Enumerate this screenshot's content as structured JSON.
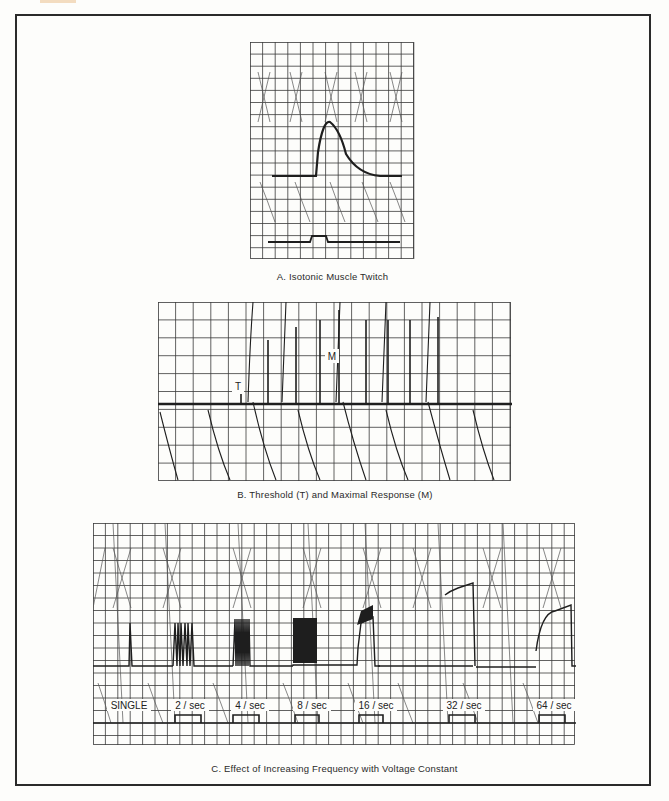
{
  "document": {
    "figure_title": "Kymograph recordings of frog gastrocnemius muscle",
    "panels": [
      {
        "id": "A",
        "caption": "A.  Isotonic Muscle Twitch"
      },
      {
        "id": "B",
        "caption": "B.  Threshold (T) and Maximal Response (M)",
        "markers": {
          "threshold": "T",
          "maximal": "M"
        }
      },
      {
        "id": "C",
        "caption": "C.  Effect of Increasing Frequency with Voltage Constant",
        "frequency_labels": [
          "SINGLE",
          "2 / sec",
          "4 / sec",
          "8 / sec",
          "16 / sec",
          "32 / sec",
          "64 / sec"
        ]
      }
    ]
  },
  "colors": {
    "ink": "#1e1e1e",
    "grid": "#3a3a3a",
    "paper": "#fdfdfb",
    "frame": "#2a2a2a",
    "tab": "#f3dcc0"
  },
  "chart_data": [
    {
      "type": "line",
      "title": "A. Isotonic Muscle Twitch",
      "series": [
        {
          "name": "muscle contraction trace",
          "x": [
            0,
            0.38,
            0.4,
            0.45,
            0.52,
            0.62,
            0.75,
            1.0
          ],
          "values": [
            0,
            0,
            0.2,
            1.0,
            0.8,
            0.4,
            0.1,
            0
          ]
        },
        {
          "name": "stimulus marker",
          "x": [
            0,
            0.35,
            0.36,
            0.48,
            0.49,
            1.0
          ],
          "values": [
            0,
            0,
            1,
            1,
            0,
            0
          ]
        }
      ]
    },
    {
      "type": "bar",
      "title": "B. Threshold (T) and Maximal Response (M)",
      "categories": [
        "1",
        "2",
        "3",
        "4",
        "5",
        "6",
        "7",
        "8",
        "9"
      ],
      "values": [
        0.15,
        0.65,
        0.85,
        0.92,
        1.0,
        0.92,
        0.92,
        0.92,
        0.92
      ],
      "annotations": [
        {
          "label": "T",
          "index": 0
        },
        {
          "label": "M",
          "index": 4
        }
      ]
    },
    {
      "type": "line",
      "title": "C. Effect of Increasing Frequency with Voltage Constant",
      "categories": [
        "SINGLE",
        "2 / sec",
        "4 / sec",
        "8 / sec",
        "16 / sec",
        "32 / sec",
        "64 / sec"
      ],
      "series": [
        {
          "name": "peak tension (relative)",
          "values": [
            0.37,
            0.37,
            0.37,
            0.37,
            0.42,
            0.62,
            0.7
          ]
        }
      ]
    }
  ]
}
